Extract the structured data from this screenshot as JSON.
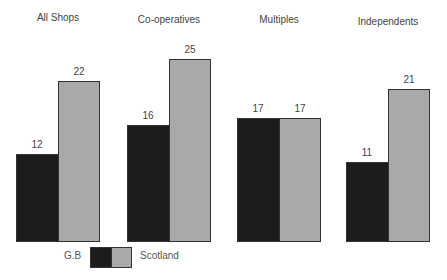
{
  "chart_data": {
    "type": "bar",
    "title": "",
    "categories": [
      "All Shops",
      "Co-operatives",
      "Multiples",
      "Independents"
    ],
    "series": [
      {
        "name": "G.B",
        "values": [
          12,
          16,
          17,
          11
        ],
        "color": "#1c1c1c"
      },
      {
        "name": "Scotland",
        "values": [
          22,
          25,
          17,
          21
        ],
        "color": "#a9a9a9"
      }
    ],
    "xlabel": "",
    "ylabel": "",
    "grid": false,
    "legend_position": "bottom"
  },
  "legend": {
    "gb_label": "G.B",
    "scotland_label": "Scotland"
  }
}
